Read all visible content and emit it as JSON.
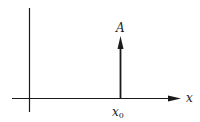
{
  "diagram": {
    "colors": {
      "stroke": "#1a1a1a",
      "background": "#ffffff"
    },
    "axes": {
      "x_label": "x",
      "vertical_axis": true,
      "horizontal_axis_arrow": true
    },
    "impulse": {
      "amplitude_label": "A",
      "position_label_main": "x",
      "position_label_sub": "0"
    }
  }
}
